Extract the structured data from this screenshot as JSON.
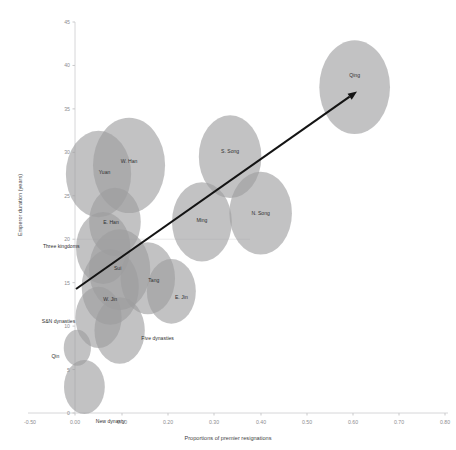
{
  "chart_data": {
    "type": "scatter",
    "title": "",
    "xlabel": "Proportions of premier resignations",
    "ylabel": "Emperor duration (years)",
    "xlim": [
      -0.5,
      0.8
    ],
    "ylim": [
      0,
      45
    ],
    "grid": false,
    "legend": "none",
    "xticks": [
      "-0.50",
      "0.00",
      "0.10",
      "0.20",
      "0.30",
      "0.40",
      "0.50",
      "0.60",
      "0.70",
      "0.80"
    ],
    "yticks": [
      "0",
      "5",
      "10",
      "15",
      "20",
      "25",
      "30",
      "35",
      "40",
      "45"
    ],
    "annotations": [
      {
        "name": "trend-arrow",
        "kind": "arrow",
        "from": [
          0.0,
          14.5
        ],
        "to": [
          0.6,
          37.0
        ]
      }
    ],
    "points": [
      {
        "label": "Qin",
        "x": 0.005,
        "y": 7.5,
        "size": 20
      },
      {
        "label": "W. Han",
        "x": 0.115,
        "y": 28.5,
        "size": 53
      },
      {
        "label": "New dynasty",
        "x": 0.02,
        "y": 3.0,
        "size": 30
      },
      {
        "label": "E. Han",
        "x": 0.085,
        "y": 22.0,
        "size": 38
      },
      {
        "label": "Three kingdoms",
        "x": 0.06,
        "y": 19.0,
        "size": 40
      },
      {
        "label": "W. Jin",
        "x": 0.075,
        "y": 14.5,
        "size": 42
      },
      {
        "label": "E. Jin",
        "x": 0.205,
        "y": 14.0,
        "size": 36
      },
      {
        "label": "S&N dynasties",
        "x": 0.05,
        "y": 11.0,
        "size": 34
      },
      {
        "label": "Sui",
        "x": 0.095,
        "y": 16.5,
        "size": 45
      },
      {
        "label": "Tang",
        "x": 0.155,
        "y": 15.5,
        "size": 40
      },
      {
        "label": "Five dynasties",
        "x": 0.095,
        "y": 9.5,
        "size": 37
      },
      {
        "label": "N. Song",
        "x": 0.395,
        "y": 23.0,
        "size": 46
      },
      {
        "label": "S. Song",
        "x": 0.33,
        "y": 29.5,
        "size": 46
      },
      {
        "label": "Yuan",
        "x": 0.05,
        "y": 27.5,
        "size": 48
      },
      {
        "label": "Ming",
        "x": 0.27,
        "y": 22.0,
        "size": 44
      },
      {
        "label": "Qing",
        "x": 0.595,
        "y": 37.5,
        "size": 52
      }
    ]
  },
  "axes": {
    "x_title": "Proportions of premier resignations",
    "y_title": "Emperor duration (years)"
  }
}
